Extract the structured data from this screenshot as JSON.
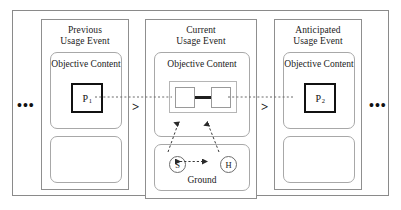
{
  "figure": {
    "ellipsis_left": "•••",
    "ellipsis_right": "•••",
    "separator_1": ">",
    "separator_2": ">"
  },
  "panels": [
    {
      "id": "previous",
      "title_line1": "Previous",
      "title_line2": "Usage Event",
      "objective_content_line1": "Objective",
      "objective_content_line2": "Content",
      "proposition_label": "P",
      "proposition_subscript": "1"
    },
    {
      "id": "current",
      "title_line1": "Current",
      "title_line2": "Usage Event",
      "objective_content_line1": "Objective",
      "objective_content_line2": "Content",
      "ground_label": "Ground",
      "speaker_label": "S",
      "hearer_label": "H"
    },
    {
      "id": "anticipated",
      "title_line1": "Anticipated",
      "title_line2": "Usage Event",
      "objective_content_line1": "Objective",
      "objective_content_line2": "Content",
      "proposition_label": "P",
      "proposition_subscript": "2"
    }
  ],
  "colors": {
    "frame": "#8a8a8a",
    "panel_border": "#8f8f8f",
    "inner_border": "#a8a8a8",
    "proposition_border": "#111111",
    "text": "#1a1a1a",
    "dashed_line": "#555555"
  }
}
